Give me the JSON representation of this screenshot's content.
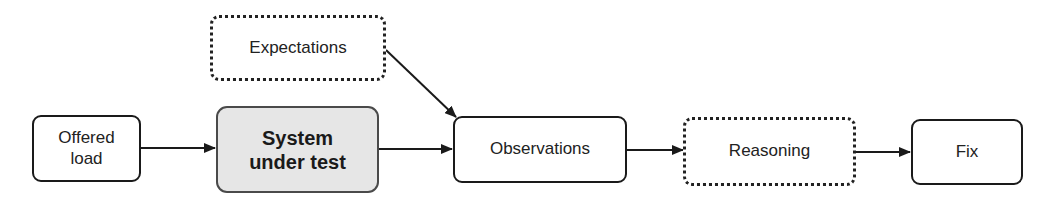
{
  "diagram": {
    "title": "",
    "nodes": {
      "offered_load": {
        "label_line1": "Offered",
        "label_line2": "load",
        "style": "solid"
      },
      "system_under_test": {
        "label_line1": "System",
        "label_line2": "under test",
        "style": "solid-filled",
        "fill": "#e6e6e6"
      },
      "expectations": {
        "label": "Expectations",
        "style": "dotted"
      },
      "observations": {
        "label": "Observations",
        "style": "solid"
      },
      "reasoning": {
        "label": "Reasoning",
        "style": "dotted"
      },
      "fix": {
        "label": "Fix",
        "style": "solid"
      }
    },
    "edges": [
      {
        "from": "Offered load",
        "to": "System under test"
      },
      {
        "from": "System under test",
        "to": "Observations"
      },
      {
        "from": "Expectations",
        "to": "Observations"
      },
      {
        "from": "Observations",
        "to": "Reasoning"
      },
      {
        "from": "Reasoning",
        "to": "Fix"
      }
    ],
    "colors": {
      "stroke": "#1a1a1a",
      "highlight_fill": "#e6e6e6"
    }
  }
}
